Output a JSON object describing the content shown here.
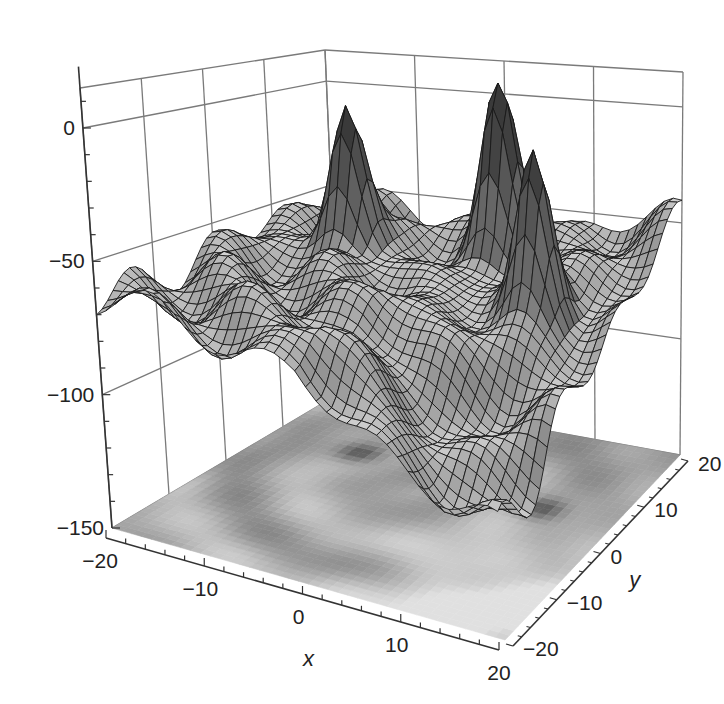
{
  "chart_data": {
    "type": "surface3d",
    "title": "",
    "xlabel": "x",
    "ylabel": "y",
    "zlabel": "",
    "x_range": [
      -20,
      20
    ],
    "y_range": [
      -20,
      20
    ],
    "z_range": [
      -150,
      15
    ],
    "x_ticks": [
      -20,
      -10,
      0,
      10,
      20
    ],
    "y_ticks": [
      -20,
      -10,
      0,
      10,
      20
    ],
    "z_ticks": [
      0,
      -50,
      -100,
      -150
    ],
    "x_tick_labels": [
      "−20",
      "−10",
      "0",
      "10",
      "20"
    ],
    "y_tick_labels": [
      "−20",
      "−10",
      "0",
      "10",
      "20"
    ],
    "z_tick_labels": [
      "0",
      "−50",
      "−100",
      "−150"
    ],
    "grid": true,
    "surface": {
      "baseline_z": -65,
      "peaks": [
        {
          "label": "left peak",
          "x": -10,
          "y": 8,
          "z": 0
        },
        {
          "label": "middle peak",
          "x": 3,
          "y": 14,
          "z": 8
        },
        {
          "label": "right peak",
          "x": 12,
          "y": 5,
          "z": 0
        }
      ],
      "lowest_region": {
        "x": 12,
        "y": -12,
        "z": -110
      },
      "mesh_lines": 40
    },
    "floor_projection": {
      "type": "contour_density",
      "z_level": -150,
      "dark_spots_at": [
        [
          -10,
          8
        ],
        [
          3,
          14
        ],
        [
          12,
          5
        ],
        [
          0,
          5
        ]
      ]
    },
    "colors": {
      "surface_light": "#d4d4d4",
      "surface_dark": "#3a3a3a",
      "mesh_line": "#1a1a1a",
      "grid_line": "#7a7a7a",
      "axis_line": "#333333",
      "floor_light": "#e0e0e0",
      "floor_dark": "#4a4a4a"
    }
  }
}
